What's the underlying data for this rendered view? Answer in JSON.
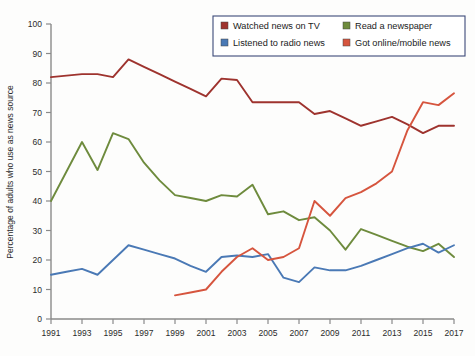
{
  "chart_data": {
    "type": "line",
    "title": "",
    "subtitle": "",
    "xlabel": "",
    "ylabel": "Percentage of adults who use as news source",
    "xlim": [
      1991,
      2017
    ],
    "ylim": [
      0,
      100
    ],
    "grid": false,
    "legend_position": "top-right",
    "x_ticks": [
      1991,
      1993,
      1995,
      1997,
      1999,
      2001,
      2003,
      2005,
      2007,
      2009,
      2011,
      2013,
      2015,
      2017
    ],
    "y_ticks": [
      0,
      10,
      20,
      30,
      40,
      50,
      60,
      70,
      80,
      90,
      100
    ],
    "x": [
      1991,
      1992,
      1993,
      1994,
      1995,
      1996,
      1997,
      1998,
      1999,
      2000,
      2001,
      2002,
      2003,
      2004,
      2005,
      2006,
      2007,
      2008,
      2009,
      2010,
      2011,
      2012,
      2013,
      2014,
      2015,
      2016,
      2017
    ],
    "series": [
      {
        "name": "Watched news on TV",
        "color": "#9e332e",
        "x": [
          1991,
          1992,
          1993,
          1994,
          1995,
          1996,
          1997,
          1998,
          1999,
          2000,
          2001,
          2002,
          2003,
          2004,
          2005,
          2006,
          2007,
          2008,
          2009,
          2010,
          2011,
          2012,
          2013,
          2014,
          2015,
          2016,
          2017
        ],
        "values": [
          82,
          82.5,
          83,
          83,
          82,
          88,
          85.5,
          83,
          80.5,
          78,
          75.5,
          81.5,
          81,
          73.5,
          73.5,
          73.5,
          73.5,
          69.5,
          70.5,
          68,
          65.5,
          67,
          68.5,
          66,
          63,
          65.5,
          65.5
        ]
      },
      {
        "name": "Read a newspaper",
        "color": "#6e8b3d",
        "x": [
          1991,
          1992,
          1993,
          1994,
          1995,
          1996,
          1997,
          1998,
          1999,
          2000,
          2001,
          2002,
          2003,
          2004,
          2005,
          2006,
          2007,
          2008,
          2009,
          2010,
          2011,
          2012,
          2013,
          2014,
          2015,
          2016,
          2017
        ],
        "values": [
          40,
          50,
          60,
          50.5,
          63,
          61,
          53,
          47,
          42,
          41,
          40,
          42,
          41.5,
          45.5,
          35.5,
          36.5,
          33.5,
          34.5,
          30,
          23.5,
          30.5,
          28.5,
          26.5,
          24.5,
          23,
          25.5,
          21
        ]
      },
      {
        "name": "Listened to radio news",
        "color": "#4a79b5",
        "x": [
          1991,
          1992,
          1993,
          1994,
          1995,
          1996,
          1997,
          1998,
          1999,
          2000,
          2001,
          2002,
          2003,
          2004,
          2005,
          2006,
          2007,
          2008,
          2009,
          2010,
          2011,
          2012,
          2013,
          2014,
          2015,
          2016,
          2017
        ],
        "values": [
          15,
          16,
          17,
          15,
          20,
          25,
          23.5,
          22,
          20.5,
          18,
          16,
          21,
          21.5,
          21,
          22,
          14,
          12.5,
          17.5,
          16.5,
          16.5,
          18,
          20,
          22,
          24,
          25.5,
          22.5,
          25
        ]
      },
      {
        "name": "Got online/mobile news",
        "color": "#d6553e",
        "x": [
          1999,
          2000,
          2001,
          2002,
          2003,
          2004,
          2005,
          2006,
          2007,
          2008,
          2009,
          2010,
          2011,
          2012,
          2013,
          2014,
          2015,
          2016,
          2017
        ],
        "values": [
          8,
          9,
          10,
          16,
          21,
          24,
          20,
          21,
          24,
          40,
          35,
          41,
          43,
          46,
          50,
          64,
          73.5,
          72.5,
          76.5
        ]
      }
    ]
  },
  "legend": {
    "items": [
      {
        "label": "Watched news on TV",
        "color": "#9e332e"
      },
      {
        "label": "Read a newspaper",
        "color": "#6e8b3d"
      },
      {
        "label": "Listened to radio news",
        "color": "#4a79b5"
      },
      {
        "label": "Got online/mobile news",
        "color": "#d6553e"
      }
    ]
  }
}
